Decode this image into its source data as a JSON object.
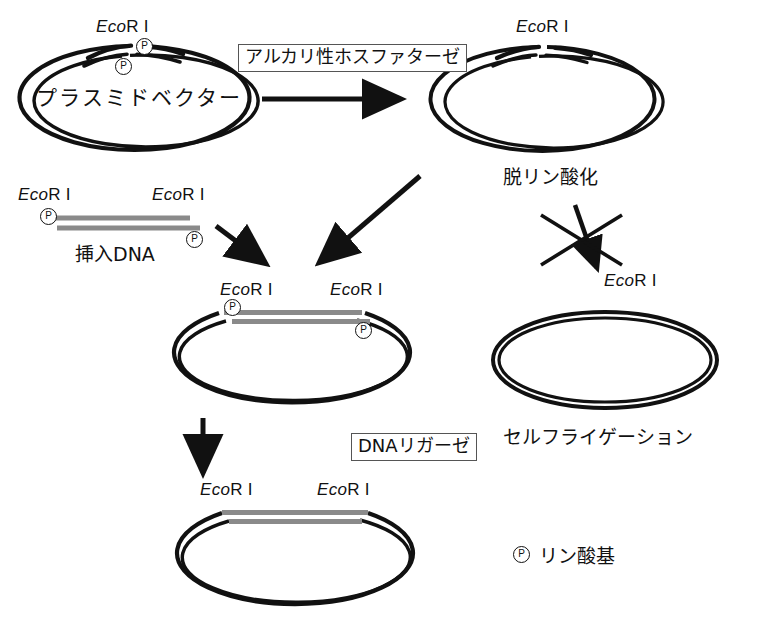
{
  "diagram": {
    "title_hidden": "",
    "colors": {
      "stroke": "#111111",
      "insert_dna": "#8a8a8a",
      "background": "#ffffff",
      "box_border": "#555555"
    }
  },
  "enzyme_boxes": [
    {
      "id": "alkaline-phosphatase",
      "label": "アルカリ性ホスファターゼ"
    },
    {
      "id": "dna-ligase",
      "label": "DNAリガーゼ"
    }
  ],
  "site_labels": {
    "prefix_italic": "Eco",
    "suffix": "R I"
  },
  "plasmid_vector": {
    "center_label": "プラスミドベクター",
    "site_label_top": "EcoR I",
    "phosphates": [
      "P",
      "P"
    ]
  },
  "dephosphorylated": {
    "site_label_top": "EcoR I",
    "caption": "脱リン酸化"
  },
  "insert_dna": {
    "caption": "挿入DNA",
    "site_label_left": "EcoR I",
    "site_label_right": "EcoR I",
    "phosphates": [
      "P",
      "P"
    ]
  },
  "recombinant": {
    "site_label_left": "EcoR I",
    "site_label_right": "EcoR I",
    "phosphates": [
      "P",
      "P"
    ]
  },
  "ligated_product": {
    "site_label_left": "EcoR I",
    "site_label_right": "EcoR I"
  },
  "self_ligation": {
    "caption": "セルフライゲーション",
    "blocked_arrow_site_label": "EcoR I",
    "blocked": true
  },
  "legend": {
    "symbol": "P",
    "label": "リン酸基"
  }
}
